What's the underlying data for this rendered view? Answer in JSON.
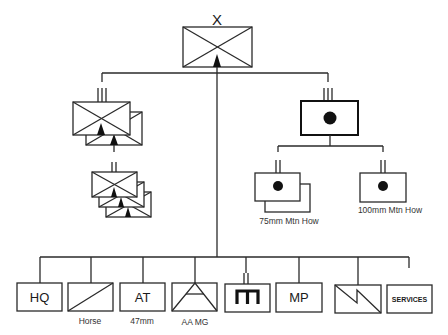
{
  "diagram": {
    "type": "military-organization-chart",
    "colors": {
      "stroke": "#2a2a2a",
      "background": "#ffffff",
      "fill_symbol": "#111111"
    },
    "division": {
      "echelon_mark": "X",
      "symbol": "mountain-infantry",
      "echelon": "brigade/division"
    },
    "infantry_regiment": {
      "echelon_mark": "III",
      "symbol": "mountain-infantry",
      "count": 2,
      "battalion": {
        "echelon_mark": "II",
        "symbol": "mountain-infantry",
        "count": 3
      }
    },
    "artillery_regiment": {
      "echelon_mark": "III",
      "symbol": "artillery",
      "battalions": [
        {
          "echelon_mark": "II",
          "symbol": "artillery",
          "count": 2,
          "label": "75mm Mtn How"
        },
        {
          "echelon_mark": "II",
          "symbol": "artillery",
          "count": 1,
          "label": "100mm Mtn How"
        }
      ]
    },
    "support_units": [
      {
        "id": "hq",
        "text": "HQ",
        "label": "",
        "symbol": "headquarters"
      },
      {
        "id": "horse",
        "text": "",
        "label": "Horse",
        "symbol": "cavalry"
      },
      {
        "id": "at",
        "text": "AT",
        "label": "47mm",
        "symbol": "anti-tank"
      },
      {
        "id": "aamg",
        "text": "",
        "label": "AA MG",
        "symbol": "anti-aircraft"
      },
      {
        "id": "engineer",
        "text": "",
        "label": "",
        "symbol": "engineer",
        "echelon_mark": "II"
      },
      {
        "id": "mp",
        "text": "MP",
        "label": "",
        "symbol": "military-police"
      },
      {
        "id": "signal",
        "text": "",
        "label": "",
        "symbol": "signal"
      },
      {
        "id": "services",
        "text": "SERVICES",
        "label": "",
        "symbol": "services"
      }
    ]
  }
}
